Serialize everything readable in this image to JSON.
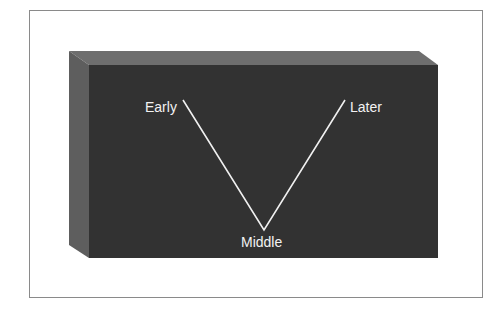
{
  "diagram": {
    "type": "v-shape-on-3d-block",
    "labels": {
      "left_top": "Early",
      "bottom": "Middle",
      "right_top": "Later"
    },
    "colors": {
      "front_face": "#333333",
      "top_face": "#6e6e6e",
      "side_face": "#5c5c5c",
      "line": "#f0f0f0",
      "frame": "#8a8a8a"
    }
  }
}
